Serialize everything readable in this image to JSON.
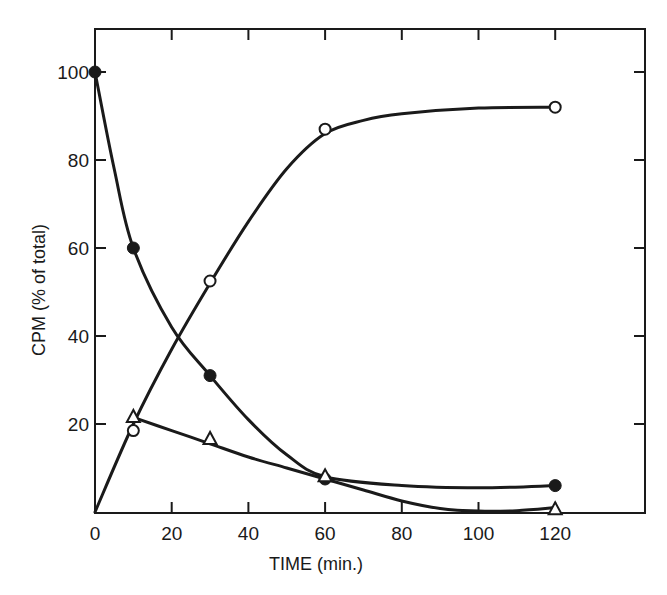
{
  "chart_data": {
    "type": "line",
    "title": "",
    "xlabel": "TIME (min.)",
    "ylabel": "CPM (% of total)",
    "xlim": [
      0,
      130
    ],
    "ylim": [
      0,
      110
    ],
    "x_ticks": [
      0,
      20,
      40,
      60,
      80,
      100,
      120
    ],
    "y_ticks": [
      20,
      40,
      60,
      80,
      100
    ],
    "y_tick_labels": [
      "20",
      "40",
      "60",
      "80",
      "100"
    ],
    "x_tick_labels": [
      "0",
      "20",
      "40",
      "60",
      "80",
      "100",
      "120"
    ],
    "grid": false,
    "legend": null,
    "series": [
      {
        "name": "filled circles",
        "marker": "filled-circle",
        "x": [
          0,
          10,
          30,
          60,
          120
        ],
        "y": [
          100,
          60,
          31,
          7.5,
          6
        ],
        "curve": [
          [
            0,
            100
          ],
          [
            5,
            78
          ],
          [
            10,
            60
          ],
          [
            20,
            42
          ],
          [
            30,
            31
          ],
          [
            40,
            21
          ],
          [
            50,
            13
          ],
          [
            60,
            8
          ],
          [
            80,
            6
          ],
          [
            100,
            5.5
          ],
          [
            120,
            6
          ]
        ]
      },
      {
        "name": "open circles",
        "marker": "open-circle",
        "x": [
          10,
          30,
          60,
          120
        ],
        "y": [
          18.5,
          52.5,
          87,
          92
        ],
        "curve": [
          [
            0,
            0
          ],
          [
            10,
            20
          ],
          [
            20,
            37
          ],
          [
            30,
            52
          ],
          [
            40,
            66
          ],
          [
            50,
            78
          ],
          [
            60,
            86
          ],
          [
            70,
            89
          ],
          [
            80,
            90.5
          ],
          [
            100,
            91.8
          ],
          [
            120,
            92
          ]
        ]
      },
      {
        "name": "open triangles",
        "marker": "open-triangle",
        "x": [
          10,
          30,
          60,
          120
        ],
        "y": [
          21.5,
          16.5,
          8,
          0.5
        ],
        "curve": [
          [
            10,
            21.5
          ],
          [
            20,
            18.5
          ],
          [
            30,
            15.5
          ],
          [
            40,
            12.5
          ],
          [
            50,
            10
          ],
          [
            60,
            7.5
          ],
          [
            70,
            5
          ],
          [
            80,
            2.5
          ],
          [
            90,
            0.8
          ],
          [
            100,
            0.2
          ],
          [
            110,
            0.3
          ],
          [
            120,
            1
          ]
        ]
      }
    ],
    "colors": {
      "line": "#1a1a1a",
      "background": "#ffffff"
    }
  }
}
